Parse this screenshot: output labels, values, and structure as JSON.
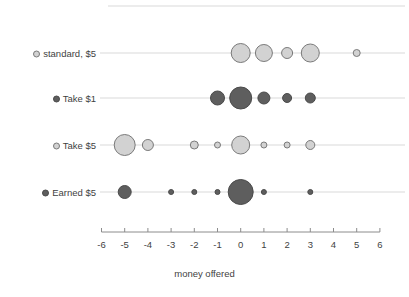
{
  "chart_data": {
    "type": "scatter",
    "title": "",
    "xlabel": "money offered",
    "ylabel": "",
    "xlim": [
      -6,
      6
    ],
    "xticks": [
      -6,
      -5,
      -4,
      -3,
      -2,
      -1,
      0,
      1,
      2,
      3,
      4,
      5,
      6
    ],
    "xticklabels": [
      "-6",
      "-5",
      "-4",
      "-3",
      "-2",
      "-1",
      "0",
      "1",
      "2",
      "3",
      "4",
      "5",
      "6"
    ],
    "grid": true,
    "legend": "none",
    "marker_note": "bubble area encodes count; open light bubbles for $5-open conditions, filled dark bubbles for filled conditions",
    "categories": [
      {
        "label": "standard, $5",
        "marker_fill": "#d2d2d2",
        "marker_stroke": "#7a7a7a",
        "points": [
          {
            "x": 0,
            "size": 19
          },
          {
            "x": 1,
            "size": 17
          },
          {
            "x": 2,
            "size": 11
          },
          {
            "x": 3,
            "size": 18
          },
          {
            "x": 5,
            "size": 7
          }
        ]
      },
      {
        "label": "Take $1",
        "marker_fill": "#5e5e5e",
        "marker_stroke": "#4a4a4a",
        "points": [
          {
            "x": -1,
            "size": 14
          },
          {
            "x": 0,
            "size": 22
          },
          {
            "x": 1,
            "size": 12
          },
          {
            "x": 2,
            "size": 9
          },
          {
            "x": 3,
            "size": 10
          }
        ]
      },
      {
        "label": "Take $5",
        "marker_fill": "#d2d2d2",
        "marker_stroke": "#7a7a7a",
        "points": [
          {
            "x": -5,
            "size": 21
          },
          {
            "x": -4,
            "size": 11
          },
          {
            "x": -2,
            "size": 8
          },
          {
            "x": -1,
            "size": 6
          },
          {
            "x": 0,
            "size": 18
          },
          {
            "x": 1,
            "size": 6
          },
          {
            "x": 2,
            "size": 6
          },
          {
            "x": 3,
            "size": 9
          }
        ]
      },
      {
        "label": "Earned $5",
        "marker_fill": "#5e5e5e",
        "marker_stroke": "#4a4a4a",
        "points": [
          {
            "x": -5,
            "size": 13
          },
          {
            "x": -3,
            "size": 5
          },
          {
            "x": -2,
            "size": 5
          },
          {
            "x": -1,
            "size": 5
          },
          {
            "x": 0,
            "size": 25
          },
          {
            "x": 1,
            "size": 5
          },
          {
            "x": 3,
            "size": 5
          }
        ]
      }
    ]
  },
  "colors": {
    "gridline": "#d9d9d9",
    "axis": "#8c8c8c",
    "text": "#3f3f3f",
    "light_bubble_fill": "#d2d2d2",
    "light_bubble_stroke": "#7a7a7a",
    "dark_bubble_fill": "#5e5e5e",
    "dark_bubble_stroke": "#4a4a4a"
  }
}
